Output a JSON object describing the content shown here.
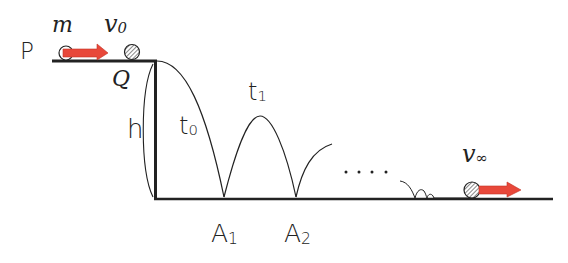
{
  "diagram": {
    "type": "physics-bouncing-ball",
    "labels": {
      "P": "P",
      "mass": "m",
      "v0": "v",
      "v0_sub": "0",
      "Q": "Q",
      "h": "h",
      "t0": "t",
      "t0_sub": "0",
      "t1": "t",
      "t1_sub": "1",
      "dots": "....",
      "A1": "A",
      "A1_sub": "1",
      "A2": "A",
      "A2_sub": "2",
      "vinf": "v",
      "vinf_sub": "∞"
    },
    "colors": {
      "line": "#222222",
      "arrow": "#e8483a",
      "ball_hatch": "#555555",
      "background": "#ffffff"
    },
    "geometry": {
      "platform_y": 61,
      "platform_x_start": 52,
      "wall_x": 155,
      "ground_y": 199,
      "ground_x_end": 553,
      "bounce_points_x": [
        224,
        296
      ]
    }
  }
}
